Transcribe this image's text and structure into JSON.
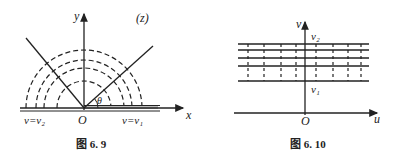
{
  "figures": [
    {
      "id": "fig-6-9",
      "caption": "图 6. 9",
      "plane_label": "(z)",
      "axes": {
        "x": "x",
        "y": "y",
        "origin": "O"
      },
      "angle_label": "θ",
      "boundary_labels": {
        "left": "v=v₂",
        "right": "v=v₁"
      },
      "description": "Upper half-plane with dashed concentric semicircular level curves centered at O, and two rays forming angle θ"
    },
    {
      "id": "fig-6-10",
      "caption": "图 6. 10",
      "axes": {
        "x": "u",
        "y": "v",
        "origin": "O"
      },
      "strip_labels": {
        "top": "v₂",
        "bottom": "v₁"
      },
      "description": "Horizontal strip between v=v₁ and v=v₂ with horizontal lines and dashed vertical segments"
    }
  ],
  "colors": {
    "stroke": "#222222",
    "background": "#ffffff"
  }
}
